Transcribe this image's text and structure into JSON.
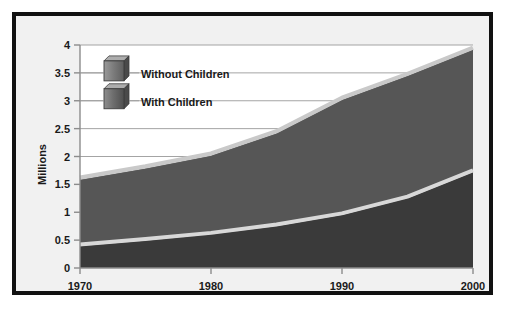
{
  "chart_data": {
    "type": "area",
    "title": "",
    "subtitle": "",
    "xlabel": "",
    "ylabel": "Millions",
    "stacked": true,
    "grid": true,
    "legend_position": "inside-top-left",
    "xlim": [
      1970,
      2000
    ],
    "ylim": [
      0,
      4
    ],
    "xticks": [
      "1970",
      "1980",
      "1990",
      "2000"
    ],
    "xtick_values": [
      1970,
      1980,
      1990,
      2000
    ],
    "yticks": [
      "0",
      "0.5",
      "1",
      "1.5",
      "2",
      "2.5",
      "3",
      "3.5",
      "4"
    ],
    "ytick_values": [
      0,
      0.5,
      1,
      1.5,
      2,
      2.5,
      3,
      3.5,
      4
    ],
    "x": [
      1970,
      1975,
      1980,
      1985,
      1990,
      1995,
      2000
    ],
    "series": [
      {
        "name": "With Children",
        "color": "#3a3a3a",
        "highlight_color": "#d8d8d8",
        "values": [
          0.42,
          0.52,
          0.63,
          0.78,
          0.98,
          1.28,
          1.75
        ]
      },
      {
        "name": "Without Children",
        "color": "#565656",
        "highlight_color": "#c9c9c9",
        "values": [
          1.2,
          1.3,
          1.42,
          1.67,
          2.07,
          2.2,
          2.2
        ]
      }
    ],
    "cumulative_totals": [
      1.62,
      1.82,
      2.05,
      2.45,
      3.05,
      3.48,
      3.95
    ],
    "annotations": []
  },
  "legend": {
    "items": [
      {
        "label": "Without Children",
        "swatch": "cube-icon-light"
      },
      {
        "label": "With Children",
        "swatch": "cube-icon-dark"
      }
    ]
  },
  "axis": {
    "y_title": "Millions",
    "y_labels": [
      "4",
      "3.5",
      "3",
      "2.5",
      "2",
      "1.5",
      "1",
      "0.5",
      "0"
    ],
    "x_labels": [
      "1970",
      "1980",
      "1990",
      "2000"
    ]
  },
  "colors": {
    "frame": "#111111",
    "background": "#f1f1f1",
    "plot_background": "#ffffff",
    "grid": "#9a9a9a",
    "axis": "#8c8c8c",
    "with_children": "#3a3a3a",
    "without_children": "#565656",
    "highlight_top": "#c9c9c9",
    "highlight_mid": "#d8d8d8",
    "text": "#1a1a1a"
  }
}
